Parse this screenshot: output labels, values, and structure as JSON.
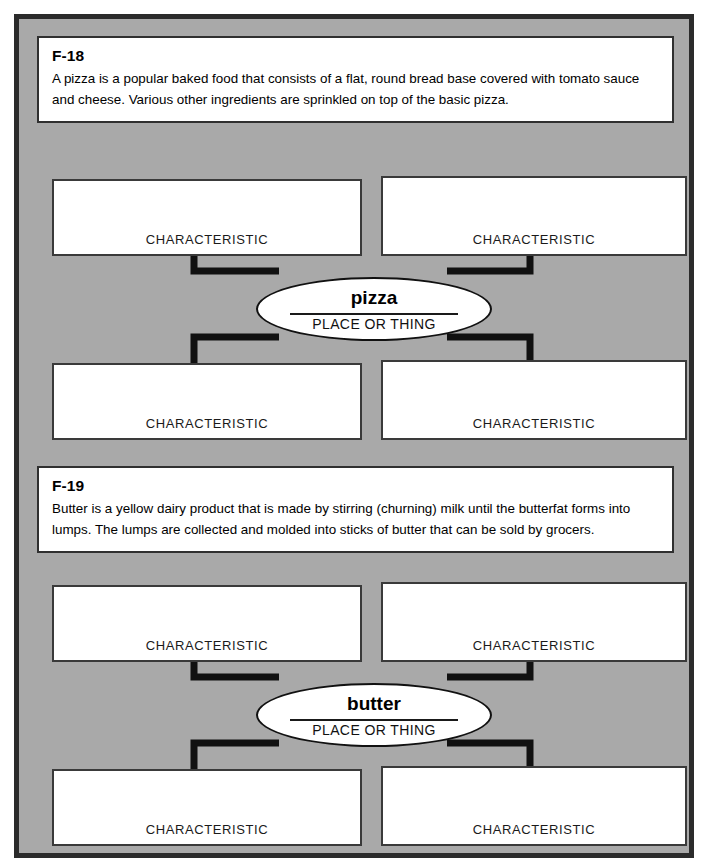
{
  "page": {
    "background_color": "#a9a9a9",
    "border_color": "#2b2b2b"
  },
  "sections": [
    {
      "code": "F-18",
      "passage": "A pizza is a popular baked food that consists of a flat, round bread base covered with tomato sauce and cheese. Various other ingredients are sprinkled on top of the basic pizza.",
      "center": {
        "term": "pizza",
        "kind": "PLACE OR THING"
      },
      "boxes": [
        {
          "label": "CHARACTERISTIC",
          "value": ""
        },
        {
          "label": "CHARACTERISTIC",
          "value": ""
        },
        {
          "label": "CHARACTERISTIC",
          "value": ""
        },
        {
          "label": "CHARACTERISTIC",
          "value": ""
        }
      ]
    },
    {
      "code": "F-19",
      "passage": "Butter is a yellow dairy product that is made by stirring (churning) milk until the butterfat forms into lumps. The lumps are collected and molded into sticks of butter that can be sold by grocers.",
      "center": {
        "term": "butter",
        "kind": "PLACE OR THING"
      },
      "boxes": [
        {
          "label": "CHARACTERISTIC",
          "value": ""
        },
        {
          "label": "CHARACTERISTIC",
          "value": ""
        },
        {
          "label": "CHARACTERISTIC",
          "value": ""
        },
        {
          "label": "CHARACTERISTIC",
          "value": ""
        }
      ]
    }
  ]
}
